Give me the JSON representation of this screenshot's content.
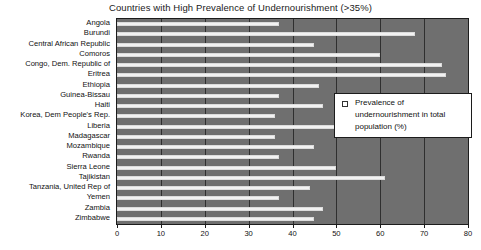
{
  "chart_data": {
    "type": "bar",
    "orientation": "horizontal",
    "title": "Countries with High Prevalence of Undernourishment (>35%)",
    "xlabel": "",
    "ylabel": "",
    "xlim": [
      0,
      80
    ],
    "xticks": [
      0,
      10,
      20,
      30,
      40,
      50,
      60,
      70,
      80
    ],
    "grid": true,
    "legend_position": "center-right",
    "series": [
      {
        "name": "Prevalence of undernourishment in total population (%)",
        "values": [
          37,
          68,
          45,
          60,
          74,
          75,
          46,
          37,
          47,
          36,
          50,
          36,
          45,
          37,
          50,
          61,
          44,
          37,
          47,
          45
        ]
      }
    ],
    "categories": [
      "Angola",
      "Burundi",
      "Central African Republic",
      "Comoros",
      "Congo, Dem. Republic of",
      "Eritrea",
      "Ethiopia",
      "Guinea-Bissau",
      "Haiti",
      "Korea, Dem People's Rep.",
      "Liberia",
      "Madagascar",
      "Mozambique",
      "Rwanda",
      "Sierra Leone",
      "Tajikistan",
      "Tanzania, United Rep of",
      "Yemen",
      "Zambia",
      "Zimbabwe"
    ]
  },
  "legend": {
    "swatch_icon": "legend-swatch-icon",
    "label": "Prevalence of undernourishment in total population (%)"
  },
  "colors": {
    "plot_background": "#6f6f6f",
    "bar_fill": "#f2f2f2",
    "gridline": "#2f2f2f",
    "axis": "#1c1c1c",
    "text": "#111111",
    "page_background": "#ffffff"
  }
}
